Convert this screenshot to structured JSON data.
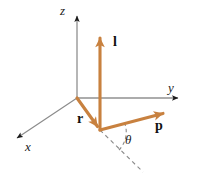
{
  "figure": {
    "background_color": "#ffffff",
    "width": 199,
    "height": 183
  },
  "colors": {
    "vector_orange": "#c8813f",
    "vector_orange_light": "#d79a62",
    "axis_gray": "#6e6e6e",
    "axis_dark": "#1a1a1a",
    "dashed_gray": "#8a8a8a",
    "label_black": "#111111"
  },
  "axes": [
    {
      "id": "z-axis",
      "label": "z",
      "style": "italic",
      "direction": "up",
      "from": [
        77,
        98
      ],
      "to": [
        77,
        12
      ],
      "arrowhead": true
    },
    {
      "id": "y-axis",
      "label": "y",
      "style": "italic",
      "direction": "right",
      "from": [
        77,
        98
      ],
      "to": [
        183,
        98
      ],
      "arrowhead": true
    },
    {
      "id": "x-axis",
      "label": "x",
      "style": "italic",
      "direction": "down-left",
      "from": [
        77,
        98
      ],
      "to": [
        12,
        141
      ],
      "arrowhead": true
    }
  ],
  "vectors": [
    {
      "id": "r-vector",
      "label": "r",
      "style": "bold",
      "description": "position vector from origin to particle",
      "from": [
        77,
        98
      ],
      "to": [
        100,
        130
      ],
      "color": "#c8813f",
      "arrowhead": true
    },
    {
      "id": "l-vector",
      "label": "l",
      "style": "bold",
      "description": "angular momentum vector, vertical, upward",
      "from": [
        100,
        130
      ],
      "to": [
        100,
        30
      ],
      "color": "#c8813f",
      "arrowhead": true
    },
    {
      "id": "p-vector",
      "label": "p",
      "style": "bold",
      "description": "linear momentum vector",
      "from": [
        100,
        130
      ],
      "to": [
        172,
        111
      ],
      "color": "#c8813f",
      "arrowhead": true
    }
  ],
  "angle": {
    "id": "theta-angle",
    "label": "θ",
    "style": "italic",
    "description": "angle between dashed reference line and p vector",
    "vertex": [
      100,
      130
    ],
    "arc_radius": 22,
    "between": [
      "dashed-reference-line",
      "p-vector"
    ]
  },
  "dashed_line": {
    "id": "dashed-reference-line",
    "description": "dashed extension of r-vector direction past particle",
    "from": [
      100,
      130
    ],
    "to": [
      143,
      172
    ],
    "color": "#8a8a8a",
    "dash_pattern": "4 3"
  },
  "labels": {
    "z": "z",
    "y": "y",
    "x": "x",
    "l": "l",
    "r": "r",
    "p": "p",
    "theta": "θ"
  }
}
